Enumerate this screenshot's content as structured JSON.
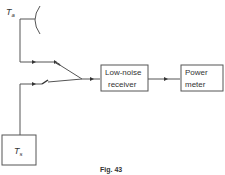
{
  "diagram": {
    "antenna_label": "T",
    "antenna_sub": "a",
    "source_label": "T",
    "source_sub": "s",
    "receiver_line1": "Low-noise",
    "receiver_line2": "receiver",
    "meter_line1": "Power",
    "meter_line2": "meter",
    "caption": "Fig. 43"
  },
  "colors": {
    "line": "#555555",
    "background": "#ffffff"
  }
}
